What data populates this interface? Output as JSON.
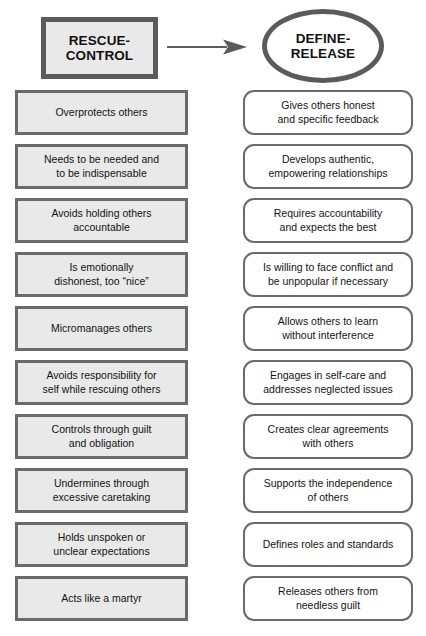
{
  "diagram": {
    "type": "two-column-comparison",
    "header": {
      "left": {
        "shape": "rectangle",
        "label": "RESCUE-\nCONTROL",
        "line1": "RESCUE-",
        "line2": "CONTROL"
      },
      "arrow": {
        "icon": "right-arrow-icon",
        "direction": "left-to-right",
        "color": "#5b5b5b"
      },
      "right": {
        "shape": "ellipse",
        "label": "DEFINE-\nRELEASE",
        "line1": "DEFINE-",
        "line2": "RELEASE"
      }
    },
    "colors": {
      "left_fill": "#e9e9e9",
      "left_border": "#6a6a6a",
      "right_fill": "#ffffff",
      "right_border": "#6a6a6a",
      "header_border": "#5b5b5b",
      "text": "#131313",
      "background": "#ffffff"
    },
    "left_column": {
      "items": [
        {
          "line1": "Overprotects others",
          "line2": ""
        },
        {
          "line1": "Needs to be needed and",
          "line2": "to be indispensable"
        },
        {
          "line1": "Avoids holding others",
          "line2": "accountable"
        },
        {
          "line1": "Is emotionally",
          "line2": "dishonest, too “nice”"
        },
        {
          "line1": "Micromanages others",
          "line2": ""
        },
        {
          "line1": "Avoids responsibility for",
          "line2": "self while rescuing others"
        },
        {
          "line1": "Controls through guilt",
          "line2": "and obligation"
        },
        {
          "line1": "Undermines through",
          "line2": "excessive caretaking"
        },
        {
          "line1": "Holds unspoken or",
          "line2": "unclear expectations"
        },
        {
          "line1": "Acts like a martyr",
          "line2": ""
        }
      ]
    },
    "right_column": {
      "items": [
        {
          "line1": "Gives others honest",
          "line2": "and specific feedback"
        },
        {
          "line1": "Develops authentic,",
          "line2": "empowering  relationships"
        },
        {
          "line1": "Requires accountability",
          "line2": "and expects the best"
        },
        {
          "line1": "Is willing to face conflict and",
          "line2": "be unpopular if necessary"
        },
        {
          "line1": "Allows others to learn",
          "line2": "without interference"
        },
        {
          "line1": "Engages in self-care and",
          "line2": "addresses neglected issues"
        },
        {
          "line1": "Creates clear agreements",
          "line2": "with others"
        },
        {
          "line1": "Supports the independence",
          "line2": "of others"
        },
        {
          "line1": "Defines roles and standards",
          "line2": ""
        },
        {
          "line1": "Releases others from",
          "line2": "needless guilt"
        }
      ]
    }
  }
}
